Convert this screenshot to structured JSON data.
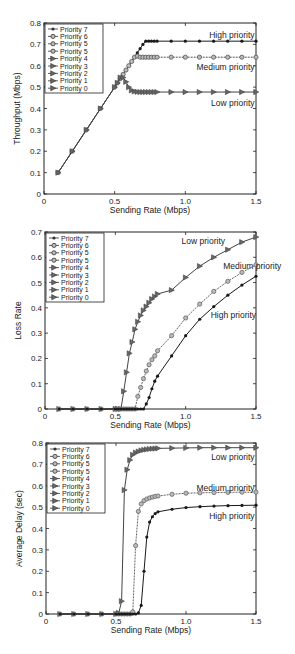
{
  "chart_data": [
    {
      "type": "line",
      "title": "",
      "xlabel": "Sending Rate (Mbps)",
      "ylabel": "Throughput (Mbps)",
      "xlim": [
        0,
        1.5
      ],
      "ylim": [
        0,
        0.8
      ],
      "xticks": [
        "0",
        "0.5",
        "1.0",
        "1.5"
      ],
      "yticks": [
        "0",
        "0.1",
        "0.2",
        "0.3",
        "0.4",
        "0.5",
        "0.6",
        "0.7",
        "0.8"
      ],
      "legend": [
        "Priority 7",
        "Priority 6",
        "Priority 5",
        "Priority 5",
        "Priority 4",
        "Priority 3",
        "Priority 2",
        "Priority 1",
        "Priority 0"
      ],
      "legend_position": "upper left",
      "annotations": [
        {
          "text": "High priority",
          "x": 1.49,
          "y": 0.745
        },
        {
          "text": "Medium priority",
          "x": 1.49,
          "y": 0.595
        },
        {
          "text": "Low priority",
          "x": 1.49,
          "y": 0.425
        }
      ],
      "series": [
        {
          "name": "High priority (Priority 7)",
          "marker": "dot",
          "color": "#1a1a1a",
          "x": [
            0.1,
            0.2,
            0.3,
            0.4,
            0.5,
            0.52,
            0.54,
            0.56,
            0.58,
            0.6,
            0.62,
            0.64,
            0.66,
            0.68,
            0.7,
            0.72,
            0.74,
            0.76,
            0.78,
            0.8,
            0.9,
            1.0,
            1.1,
            1.2,
            1.3,
            1.4,
            1.5
          ],
          "y": [
            0.1,
            0.2,
            0.3,
            0.4,
            0.5,
            0.52,
            0.54,
            0.56,
            0.58,
            0.6,
            0.62,
            0.64,
            0.66,
            0.68,
            0.7,
            0.715,
            0.715,
            0.715,
            0.715,
            0.715,
            0.715,
            0.715,
            0.715,
            0.715,
            0.715,
            0.715,
            0.715
          ]
        },
        {
          "name": "Medium priority (Priority 6/5)",
          "marker": "circle",
          "color": "#555555",
          "x": [
            0.1,
            0.2,
            0.3,
            0.4,
            0.5,
            0.52,
            0.54,
            0.56,
            0.58,
            0.6,
            0.62,
            0.64,
            0.66,
            0.68,
            0.7,
            0.72,
            0.74,
            0.76,
            0.78,
            0.8,
            0.9,
            1.0,
            1.1,
            1.2,
            1.3,
            1.4,
            1.5
          ],
          "y": [
            0.1,
            0.2,
            0.3,
            0.4,
            0.5,
            0.52,
            0.54,
            0.56,
            0.58,
            0.6,
            0.62,
            0.64,
            0.645,
            0.64,
            0.64,
            0.64,
            0.64,
            0.64,
            0.64,
            0.64,
            0.64,
            0.64,
            0.64,
            0.64,
            0.64,
            0.64,
            0.64
          ]
        },
        {
          "name": "Low priority (Priority 4-0)",
          "marker": "triangle",
          "color": "#444444",
          "x": [
            0.1,
            0.2,
            0.3,
            0.4,
            0.5,
            0.52,
            0.54,
            0.56,
            0.58,
            0.6,
            0.62,
            0.64,
            0.66,
            0.68,
            0.7,
            0.72,
            0.74,
            0.76,
            0.78,
            0.8,
            0.9,
            1.0,
            1.1,
            1.2,
            1.3,
            1.4,
            1.5
          ],
          "y": [
            0.1,
            0.2,
            0.3,
            0.4,
            0.5,
            0.52,
            0.545,
            0.545,
            0.525,
            0.5,
            0.485,
            0.48,
            0.478,
            0.477,
            0.477,
            0.477,
            0.477,
            0.477,
            0.477,
            0.477,
            0.477,
            0.477,
            0.477,
            0.477,
            0.477,
            0.477,
            0.477
          ]
        }
      ]
    },
    {
      "type": "line",
      "title": "",
      "xlabel": "Sending Rate (Mbps)",
      "ylabel": "Loss Rate",
      "xlim": [
        0,
        1.5
      ],
      "ylim": [
        0,
        0.7
      ],
      "xticks": [
        "0",
        "0.5",
        "1.0",
        "1.5"
      ],
      "yticks": [
        "0",
        "0.1",
        "0.2",
        "0.3",
        "0.4",
        "0.5",
        "0.6",
        "0.7"
      ],
      "legend": [
        "Priority 7",
        "Priority 6",
        "Priority 5",
        "Priority 5",
        "Priority 4",
        "Priority 3",
        "Priority 2",
        "Priority 1",
        "Priority 0"
      ],
      "legend_position": "upper left",
      "annotations": [
        {
          "text": "Low priority",
          "x": 1.28,
          "y": 0.665
        },
        {
          "text": "Medium priority",
          "x": 1.68,
          "y": 0.565
        },
        {
          "text": "High priority",
          "x": 1.5,
          "y": 0.37
        }
      ],
      "series": [
        {
          "name": "Low priority (Priority 4-0)",
          "marker": "triangle",
          "color": "#444444",
          "x": [
            0.1,
            0.2,
            0.3,
            0.4,
            0.5,
            0.52,
            0.54,
            0.56,
            0.58,
            0.6,
            0.62,
            0.64,
            0.66,
            0.68,
            0.7,
            0.72,
            0.74,
            0.76,
            0.78,
            0.8,
            0.9,
            1.0,
            1.1,
            1.2,
            1.3,
            1.4,
            1.5
          ],
          "y": [
            0,
            0,
            0,
            0,
            0,
            0,
            0,
            0.07,
            0.145,
            0.22,
            0.265,
            0.315,
            0.345,
            0.37,
            0.39,
            0.405,
            0.42,
            0.435,
            0.445,
            0.455,
            0.47,
            0.52,
            0.565,
            0.6,
            0.63,
            0.66,
            0.68
          ]
        },
        {
          "name": "Medium priority (Priority 6/5)",
          "marker": "circle",
          "color": "#666666",
          "x": [
            0.1,
            0.2,
            0.3,
            0.4,
            0.5,
            0.52,
            0.54,
            0.56,
            0.58,
            0.6,
            0.62,
            0.64,
            0.66,
            0.68,
            0.7,
            0.72,
            0.74,
            0.76,
            0.78,
            0.8,
            0.9,
            1.0,
            1.1,
            1.2,
            1.3,
            1.4,
            1.5
          ],
          "y": [
            0,
            0,
            0,
            0,
            0,
            0,
            0,
            0,
            0,
            0,
            0,
            0,
            0.05,
            0.085,
            0.12,
            0.15,
            0.175,
            0.195,
            0.21,
            0.23,
            0.29,
            0.36,
            0.415,
            0.465,
            0.505,
            0.54,
            0.57
          ]
        },
        {
          "name": "High priority (Priority 7)",
          "marker": "dot",
          "color": "#1a1a1a",
          "x": [
            0.1,
            0.2,
            0.3,
            0.4,
            0.5,
            0.52,
            0.54,
            0.56,
            0.58,
            0.6,
            0.62,
            0.64,
            0.66,
            0.68,
            0.7,
            0.72,
            0.74,
            0.76,
            0.78,
            0.8,
            0.9,
            1.0,
            1.1,
            1.2,
            1.3,
            1.4,
            1.5
          ],
          "y": [
            0,
            0,
            0,
            0,
            0,
            0,
            0,
            0,
            0,
            0,
            0,
            0,
            0,
            0,
            0,
            0.02,
            0.045,
            0.08,
            0.11,
            0.13,
            0.21,
            0.29,
            0.355,
            0.405,
            0.45,
            0.49,
            0.525
          ]
        }
      ]
    },
    {
      "type": "line",
      "title": "",
      "xlabel": "Sending Rate (Mbps)",
      "ylabel": "Average Delay (sec)",
      "xlim": [
        0,
        1.5
      ],
      "ylim": [
        0,
        0.8
      ],
      "xticks": [
        "0",
        "0.5",
        "1.0",
        "1.5"
      ],
      "yticks": [
        "0",
        "0.1",
        "0.2",
        "0.3",
        "0.4",
        "0.5",
        "0.6",
        "0.7",
        "0.8"
      ],
      "legend": [
        "Priority 7",
        "Priority 6",
        "Priority 5",
        "Priority 5",
        "Priority 4",
        "Priority 3",
        "Priority 2",
        "Priority 1",
        "Priority 0"
      ],
      "legend_position": "upper left",
      "annotations": [
        {
          "text": "Low priority",
          "x": 1.49,
          "y": 0.735
        },
        {
          "text": "Medium priority",
          "x": 1.49,
          "y": 0.59
        },
        {
          "text": "High priority",
          "x": 1.49,
          "y": 0.46
        }
      ],
      "series": [
        {
          "name": "Low priority (Priority 4-0)",
          "marker": "triangle",
          "color": "#444444",
          "x": [
            0.1,
            0.2,
            0.3,
            0.4,
            0.5,
            0.52,
            0.54,
            0.56,
            0.58,
            0.6,
            0.62,
            0.64,
            0.66,
            0.68,
            0.7,
            0.72,
            0.74,
            0.76,
            0.78,
            0.8,
            0.9,
            1.0,
            1.1,
            1.2,
            1.3,
            1.4,
            1.5
          ],
          "y": [
            0,
            0,
            0,
            0,
            0,
            0.005,
            0.06,
            0.58,
            0.675,
            0.72,
            0.745,
            0.755,
            0.76,
            0.765,
            0.768,
            0.77,
            0.772,
            0.773,
            0.774,
            0.775,
            0.776,
            0.777,
            0.778,
            0.778,
            0.778,
            0.778,
            0.778
          ]
        },
        {
          "name": "Medium priority (Priority 6/5)",
          "marker": "circle",
          "color": "#666666",
          "x": [
            0.1,
            0.2,
            0.3,
            0.4,
            0.5,
            0.52,
            0.54,
            0.56,
            0.58,
            0.6,
            0.62,
            0.64,
            0.66,
            0.68,
            0.7,
            0.72,
            0.74,
            0.76,
            0.78,
            0.8,
            0.9,
            1.0,
            1.1,
            1.2,
            1.3,
            1.4,
            1.5
          ],
          "y": [
            0,
            0,
            0,
            0,
            0,
            0,
            0,
            0,
            0,
            0,
            0.01,
            0.32,
            0.48,
            0.515,
            0.53,
            0.538,
            0.543,
            0.547,
            0.55,
            0.552,
            0.56,
            0.565,
            0.567,
            0.568,
            0.569,
            0.57,
            0.57
          ]
        },
        {
          "name": "High priority (Priority 7)",
          "marker": "dot",
          "color": "#1a1a1a",
          "x": [
            0.1,
            0.2,
            0.3,
            0.4,
            0.5,
            0.52,
            0.54,
            0.56,
            0.58,
            0.6,
            0.62,
            0.64,
            0.66,
            0.68,
            0.7,
            0.72,
            0.74,
            0.76,
            0.78,
            0.8,
            0.9,
            1.0,
            1.1,
            1.2,
            1.3,
            1.4,
            1.5
          ],
          "y": [
            0,
            0,
            0,
            0,
            0,
            0,
            0,
            0,
            0,
            0,
            0,
            0,
            0.005,
            0.04,
            0.2,
            0.36,
            0.43,
            0.455,
            0.47,
            0.478,
            0.49,
            0.498,
            0.502,
            0.505,
            0.507,
            0.508,
            0.509
          ]
        }
      ]
    }
  ],
  "layout": {
    "panels": [
      {
        "left": 44,
        "right": 256,
        "top": 23,
        "bottom": 194
      },
      {
        "left": 45,
        "right": 256,
        "top": 232,
        "bottom": 409
      },
      {
        "left": 46,
        "right": 256,
        "top": 443,
        "bottom": 614
      }
    ]
  }
}
